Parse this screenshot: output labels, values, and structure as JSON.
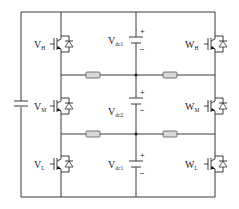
{
  "diagram": {
    "type": "three-level inverter circuit",
    "switches": [
      {
        "id": "VH",
        "main": "V",
        "sub": "H"
      },
      {
        "id": "VM",
        "main": "V",
        "sub": "M"
      },
      {
        "id": "VL",
        "main": "V",
        "sub": "L"
      },
      {
        "id": "WH",
        "main": "W",
        "sub": "H"
      },
      {
        "id": "WM",
        "main": "W",
        "sub": "M"
      },
      {
        "id": "WL",
        "main": "W",
        "sub": "L"
      }
    ],
    "dc_sources": [
      {
        "id": "dc1_top",
        "main": "V",
        "sub": "dc1",
        "plus": "+",
        "minus": "−"
      },
      {
        "id": "dc2",
        "main": "V",
        "sub": "dc2",
        "plus": "+",
        "minus": "−"
      },
      {
        "id": "dc1_bottom",
        "main": "V",
        "sub": "dc1",
        "plus": "+",
        "minus": "−"
      }
    ],
    "resistors": 4,
    "colors": {
      "wire": "#3a3a3a",
      "resistor_fill": "#d9d9d9",
      "background": "#ffffff"
    }
  }
}
